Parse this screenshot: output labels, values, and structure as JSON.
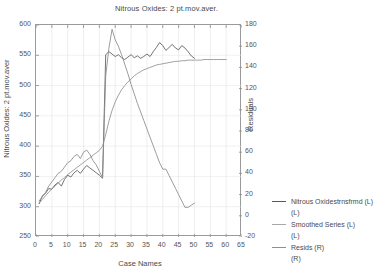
{
  "chart_data": {
    "type": "line",
    "title": "Nitrous Oxides: 2 pt.mov.aver.",
    "xlabel": "Case Names",
    "ylabel": "Nitrous Oxides: 2 pt.mov.aver",
    "ylabel_right": "Residuals",
    "grid": true,
    "legend_position": "right",
    "xlim": [
      0,
      65
    ],
    "ylim": [
      250,
      600
    ],
    "ylim_right": [
      -20,
      180
    ],
    "xticks": [
      0,
      5,
      10,
      15,
      20,
      25,
      30,
      35,
      40,
      45,
      50,
      55,
      60,
      65
    ],
    "yticks_left": [
      250,
      300,
      350,
      400,
      450,
      500,
      550,
      600
    ],
    "yticks_right": [
      -20,
      0,
      20,
      40,
      60,
      80,
      100,
      120,
      140,
      160,
      180
    ],
    "series": [
      {
        "name": "Nitrous Oxidestrnsfrmd (L)",
        "axis": "left",
        "color": "#5a5a5a",
        "x": [
          1,
          2,
          3,
          4,
          5,
          6,
          7,
          8,
          9,
          10,
          11,
          12,
          13,
          14,
          15,
          16,
          17,
          18,
          19,
          20,
          21,
          22,
          23,
          24,
          25,
          26,
          27,
          28,
          29,
          30,
          31,
          32,
          33,
          34,
          35,
          36,
          37,
          38,
          39,
          40,
          41,
          42,
          43,
          44,
          45,
          46,
          47,
          48,
          49,
          50
        ],
        "values": [
          305,
          318,
          322,
          330,
          329,
          336,
          340,
          334,
          345,
          352,
          349,
          356,
          360,
          355,
          362,
          368,
          364,
          360,
          356,
          352,
          347,
          551,
          556,
          552,
          548,
          551,
          546,
          543,
          547,
          551,
          546,
          549,
          545,
          548,
          552,
          548,
          556,
          563,
          571,
          566,
          558,
          563,
          568,
          562,
          559,
          566,
          562,
          556,
          549,
          545
        ]
      },
      {
        "name": "Smoothed Series (L)",
        "axis": "left",
        "color": "#909090",
        "x": [
          1,
          2,
          3,
          4,
          5,
          6,
          7,
          8,
          9,
          10,
          11,
          12,
          13,
          14,
          15,
          16,
          17,
          18,
          19,
          20,
          21,
          22,
          23,
          24,
          25,
          26,
          27,
          28,
          29,
          30,
          31,
          32,
          33,
          34,
          35,
          36,
          37,
          38,
          39,
          40,
          41,
          42,
          43,
          44,
          45,
          46,
          47,
          48,
          49,
          50,
          51,
          52,
          53,
          54,
          55,
          56,
          57,
          58,
          59,
          60
        ],
        "values": [
          306,
          312,
          318,
          324,
          329,
          334,
          339,
          344,
          348,
          353,
          357,
          361,
          365,
          369,
          373,
          377,
          381,
          385,
          389,
          393,
          400,
          419,
          441,
          459,
          473,
          484,
          493,
          500,
          506,
          511,
          516,
          520,
          523,
          526,
          528,
          530,
          532,
          534,
          535,
          536,
          537,
          538,
          539,
          540,
          540,
          541,
          541,
          542,
          542,
          542,
          542,
          542,
          543,
          543,
          543,
          543,
          543,
          543,
          543,
          543
        ]
      },
      {
        "name": "Resids (R)",
        "axis": "right",
        "color": "#8a8a8a",
        "x": [
          1,
          2,
          3,
          4,
          5,
          6,
          7,
          8,
          9,
          10,
          11,
          12,
          13,
          14,
          15,
          16,
          17,
          18,
          19,
          20,
          21,
          22,
          23,
          24,
          25,
          26,
          27,
          28,
          29,
          30,
          31,
          32,
          33,
          34,
          35,
          36,
          37,
          38,
          39,
          40,
          41,
          42,
          43,
          44,
          45,
          46,
          47,
          48,
          49,
          50
        ],
        "values": [
          14,
          18,
          22,
          28,
          32,
          36,
          40,
          42,
          46,
          50,
          52,
          56,
          58,
          54,
          60,
          62,
          58,
          52,
          48,
          42,
          36,
          132,
          158,
          176,
          166,
          160,
          152,
          143,
          134,
          124,
          115,
          106,
          98,
          90,
          82,
          74,
          66,
          58,
          50,
          44,
          44,
          38,
          32,
          26,
          20,
          14,
          8,
          8,
          10,
          12
        ]
      }
    ],
    "legend_entries": [
      {
        "label": "Nitrous Oxidestrnsfrmd (L)",
        "sub": "(L)",
        "color": "#5a5a5a"
      },
      {
        "label": "Smoothed Series (L)",
        "sub": "(L)",
        "color": "#a8a8a8"
      },
      {
        "label": "Resids (R)",
        "sub": "(R)",
        "color": "#909090"
      }
    ]
  }
}
